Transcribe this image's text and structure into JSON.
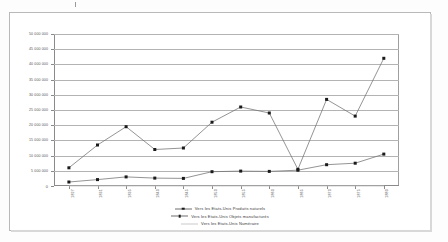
{
  "document": {
    "kind": "scanned-chart-page",
    "top_mark": ""
  },
  "chart_data": {
    "type": "line",
    "title": "",
    "subtitle": "",
    "xlabel": "",
    "ylabel": "",
    "grid": true,
    "legend_position": "bottom",
    "ylim": [
      0,
      50000000
    ],
    "ytick_labels": [
      "50 000 000",
      "45 000 000",
      "40 000 000",
      "35 000 000",
      "30 000 000",
      "25 000 000",
      "20 000 000",
      "15 000 000",
      "10 000 000",
      "5 000 000",
      "0"
    ],
    "ytick_values": [
      50000000,
      45000000,
      40000000,
      35000000,
      30000000,
      25000000,
      20000000,
      15000000,
      10000000,
      5000000,
      0
    ],
    "categories": [
      "1827",
      "1831",
      "1835",
      "1840",
      "1845",
      "1850",
      "1855",
      "1860",
      "1865",
      "1870",
      "1875",
      "1880"
    ],
    "series": [
      {
        "name": "Vers les Etats-Unis Produits naturels",
        "marker": "square",
        "values": [
          6000000,
          13500000,
          19500000,
          12000000,
          12500000,
          21000000,
          26000000,
          24000000,
          5500000,
          28500000,
          23000000,
          42000000
        ]
      },
      {
        "name": "Vers les Etats-Unis Objets manufacturés",
        "marker": "square",
        "values": [
          1300000,
          2100000,
          3000000,
          2600000,
          2500000,
          4700000,
          4900000,
          4800000,
          5200000,
          7000000,
          7500000,
          10500000
        ]
      },
      {
        "name": "Vers les Etats-Unis Numéraire",
        "marker": "none",
        "values": [
          0,
          0,
          0,
          0,
          0,
          0,
          0,
          0,
          0,
          0,
          0,
          0
        ]
      }
    ]
  },
  "legend": {
    "items": [
      {
        "label": "Vers les Etats-Unis Produits naturels",
        "key": "square"
      },
      {
        "label": "Vers les Etats-Unis Objets manufacturés",
        "key": "square"
      },
      {
        "label": "Vers les Etats-Unis Numéraire",
        "key": "none"
      }
    ]
  }
}
